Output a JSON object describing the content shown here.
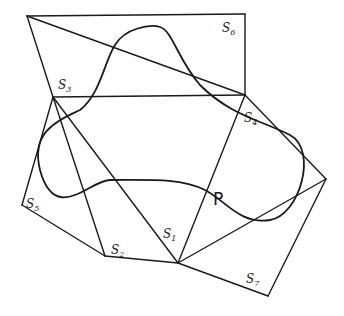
{
  "diagram": {
    "vertices": {
      "A": [
        27,
        16
      ],
      "B": [
        245,
        14
      ],
      "C": [
        245,
        95
      ],
      "D": [
        53,
        97
      ],
      "E": [
        22,
        205
      ],
      "F": [
        105,
        256
      ],
      "G": [
        178,
        263
      ],
      "H": [
        268,
        296
      ],
      "I": [
        326,
        179
      ]
    },
    "edges": [
      [
        "A",
        "B"
      ],
      [
        "B",
        "C"
      ],
      [
        "A",
        "C"
      ],
      [
        "A",
        "D"
      ],
      [
        "D",
        "C"
      ],
      [
        "C",
        "I"
      ],
      [
        "D",
        "E"
      ],
      [
        "E",
        "F"
      ],
      [
        "F",
        "G"
      ],
      [
        "D",
        "F"
      ],
      [
        "D",
        "G"
      ],
      [
        "C",
        "G"
      ],
      [
        "G",
        "I"
      ],
      [
        "G",
        "H"
      ],
      [
        "H",
        "I"
      ]
    ],
    "curve_path": "M 115 45 C 125 28, 150 24, 160 27 C 172 30, 178 60, 200 85 C 230 115, 260 120, 290 135 C 318 150, 300 215, 270 220 C 240 225, 225 200, 205 190 C 180 178, 150 180, 110 180 C 90 180, 55 225, 40 170 C 30 130, 60 120, 80 110 C 100 95, 105 60, 115 45 Z",
    "labels": [
      {
        "name": "label-s6",
        "text": "S",
        "sub": "6",
        "x": 222,
        "y": 32
      },
      {
        "name": "label-s3",
        "text": "S",
        "sub": "3",
        "x": 58,
        "y": 89
      },
      {
        "name": "label-s4",
        "text": "S",
        "sub": "4",
        "x": 244,
        "y": 122
      },
      {
        "name": "label-s5",
        "text": "S",
        "sub": "5",
        "x": 26,
        "y": 208
      },
      {
        "name": "label-s2",
        "text": "S",
        "sub": "2",
        "x": 111,
        "y": 254
      },
      {
        "name": "label-s1",
        "text": "S",
        "sub": "1",
        "x": 163,
        "y": 238
      },
      {
        "name": "label-s7",
        "text": "S",
        "sub": "7",
        "x": 246,
        "y": 283
      }
    ],
    "p_label": {
      "text": "P",
      "x": 213,
      "y": 205
    }
  }
}
